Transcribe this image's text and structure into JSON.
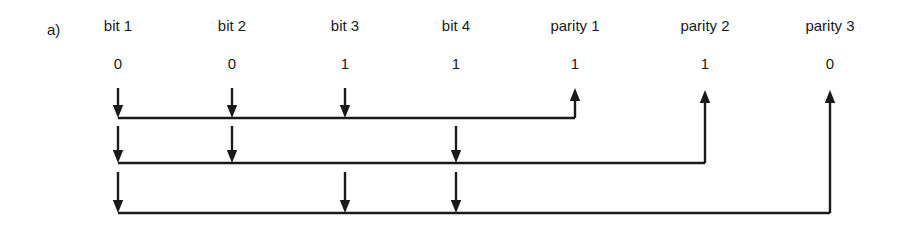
{
  "figure": {
    "panel_label": "a)",
    "background_color": "#ffffff",
    "ink_color": "#1a1a1a",
    "width": 908,
    "height": 230
  },
  "columns": [
    {
      "id": "bit-1",
      "label": "bit 1",
      "value": "0",
      "x": 118
    },
    {
      "id": "bit-2",
      "label": "bit 2",
      "value": "0",
      "x": 232
    },
    {
      "id": "bit-3",
      "label": "bit 3",
      "value": "1",
      "x": 345
    },
    {
      "id": "bit-4",
      "label": "bit 4",
      "value": "1",
      "x": 456
    },
    {
      "id": "parity-1",
      "label": "parity 1",
      "value": "1",
      "x": 575
    },
    {
      "id": "parity-2",
      "label": "parity 2",
      "value": "1",
      "x": 705
    },
    {
      "id": "parity-3",
      "label": "parity 3",
      "value": "0",
      "x": 830
    }
  ],
  "parity_rows": [
    {
      "id": "parity-row-1",
      "bus_y": 118,
      "stem_top": 88,
      "source_columns": [
        "bit-1",
        "bit-2",
        "bit-3"
      ],
      "target_column": "parity-1",
      "target_arrow_top": 88
    },
    {
      "id": "parity-row-2",
      "bus_y": 163,
      "stem_top": 126,
      "source_columns": [
        "bit-1",
        "bit-2",
        "bit-4"
      ],
      "target_column": "parity-2",
      "target_arrow_top": 90
    },
    {
      "id": "parity-row-3",
      "bus_y": 213,
      "stem_top": 172,
      "source_columns": [
        "bit-1",
        "bit-3",
        "bit-4"
      ],
      "target_column": "parity-3",
      "target_arrow_top": 90
    }
  ]
}
